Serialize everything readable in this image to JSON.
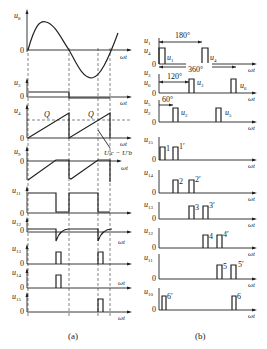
{
  "panel_a": {
    "caption": "(a)",
    "zero": "0",
    "axis_label": "ωt",
    "signals": [
      {
        "name": "u",
        "sub": "8"
      },
      {
        "name": "u",
        "sub": "3"
      },
      {
        "name": "u",
        "sub": "4"
      },
      {
        "name": "u",
        "sub": "9"
      },
      {
        "name": "u",
        "sub": "11"
      },
      {
        "name": "u",
        "sub": "12"
      },
      {
        "name": "u",
        "sub": "13"
      },
      {
        "name": "u",
        "sub": "14"
      },
      {
        "name": "u",
        "sub": "15"
      }
    ],
    "annotations": {
      "q1": "Q",
      "q2": "Q",
      "uc_ub": "U′c − U′b"
    }
  },
  "panel_b": {
    "caption": "(b)",
    "zero": "0",
    "axis_label": "ωt",
    "angles": {
      "a180": "180°",
      "a360": "360°",
      "a120": "120°",
      "a60": "60°"
    },
    "rows": [
      {
        "labels": [
          "u1",
          "u4"
        ],
        "pulses": [
          "u1",
          "u4"
        ]
      },
      {
        "labels": [
          "u3",
          "u6"
        ],
        "pulses": [
          "u3",
          "u6"
        ]
      },
      {
        "labels": [
          "u5",
          "u2"
        ],
        "pulses": [
          "u2",
          "u5"
        ]
      },
      {
        "label": "u15",
        "pulses": [
          "1",
          "1′"
        ]
      },
      {
        "label": "u14",
        "pulses": [
          "2",
          "2′"
        ]
      },
      {
        "label": "u13",
        "pulses": [
          "3",
          "3′"
        ]
      },
      {
        "label": "u12",
        "pulses": [
          "4",
          "4′"
        ]
      },
      {
        "label": "u11",
        "pulses": [
          "5",
          "5′"
        ]
      },
      {
        "label": "u10",
        "pulses": [
          "6′",
          "6"
        ]
      }
    ]
  }
}
